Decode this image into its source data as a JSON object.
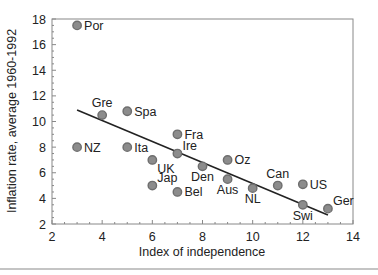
{
  "chart_data": {
    "type": "scatter",
    "title": "",
    "xlabel": "Index of independence",
    "ylabel": "Inflation rate, average 1960-1992",
    "xlim": [
      2,
      14
    ],
    "ylim": [
      2,
      18
    ],
    "xticks": [
      2,
      4,
      6,
      8,
      10,
      12,
      14
    ],
    "yticks": [
      2,
      4,
      6,
      8,
      10,
      12,
      14,
      16,
      18
    ],
    "grid": false,
    "legend": null,
    "points": [
      {
        "label": "Por",
        "x": 3,
        "y": 17.5,
        "label_pos": "right"
      },
      {
        "label": "Gre",
        "x": 4,
        "y": 10.5,
        "label_pos": "above"
      },
      {
        "label": "Spa",
        "x": 5,
        "y": 10.8,
        "label_pos": "right"
      },
      {
        "label": "NZ",
        "x": 3,
        "y": 8.0,
        "label_pos": "right"
      },
      {
        "label": "Ita",
        "x": 5,
        "y": 8.0,
        "label_pos": "right"
      },
      {
        "label": "Fra",
        "x": 7,
        "y": 9.0,
        "label_pos": "right"
      },
      {
        "label": "Ire",
        "x": 7,
        "y": 7.5,
        "label_pos": "above-right"
      },
      {
        "label": "UK",
        "x": 6,
        "y": 7.0,
        "label_pos": "below-right"
      },
      {
        "label": "Den",
        "x": 8,
        "y": 6.5,
        "label_pos": "below"
      },
      {
        "label": "Oz",
        "x": 9,
        "y": 7.0,
        "label_pos": "right"
      },
      {
        "label": "Jap",
        "x": 6,
        "y": 5.0,
        "label_pos": "above-right"
      },
      {
        "label": "Bel",
        "x": 7,
        "y": 4.5,
        "label_pos": "right"
      },
      {
        "label": "Aus",
        "x": 9,
        "y": 5.5,
        "label_pos": "below"
      },
      {
        "label": "NL",
        "x": 10,
        "y": 4.8,
        "label_pos": "below"
      },
      {
        "label": "Can",
        "x": 11,
        "y": 5.0,
        "label_pos": "above"
      },
      {
        "label": "US",
        "x": 12,
        "y": 5.1,
        "label_pos": "right"
      },
      {
        "label": "Swi",
        "x": 12,
        "y": 3.5,
        "label_pos": "below"
      },
      {
        "label": "Ger",
        "x": 13,
        "y": 3.2,
        "label_pos": "above-right"
      }
    ],
    "trendline": {
      "x0": 3,
      "y0": 10.9,
      "x1": 13,
      "y1": 2.7
    },
    "colors": {
      "marker_fill": "#8c8c8c",
      "marker_stroke": "#6e6e6e",
      "line": "#222222",
      "axis": "#888888"
    }
  }
}
